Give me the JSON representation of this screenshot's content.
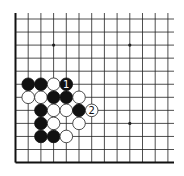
{
  "diagram": {
    "type": "go-board-fragment",
    "colors": {
      "background": "#ffffff",
      "line": "#222222",
      "border": "#111111",
      "black_stone": "#111111",
      "white_stone": "#ffffff",
      "white_stone_outline": "#222222"
    },
    "grid": {
      "columns": 13,
      "rows": 12,
      "origin_x": 15.5,
      "origin_y": 19,
      "col_spacing": 12.7,
      "row_spacing": 13.05,
      "line_extend_right": 174,
      "line_extend_top": 13,
      "thick_edges": [
        "left",
        "bottom"
      ]
    },
    "star_points": [
      {
        "col": 3,
        "row": 2
      },
      {
        "col": 9,
        "row": 2
      },
      {
        "col": 9,
        "row": 8
      }
    ],
    "stones": [
      {
        "col": 1,
        "row": 5,
        "color": "black"
      },
      {
        "col": 2,
        "row": 5,
        "color": "black"
      },
      {
        "col": 3,
        "row": 5,
        "color": "white"
      },
      {
        "col": 4,
        "row": 5,
        "color": "black",
        "label": "1"
      },
      {
        "col": 1,
        "row": 6,
        "color": "white"
      },
      {
        "col": 2,
        "row": 6,
        "color": "white"
      },
      {
        "col": 3,
        "row": 6,
        "color": "black"
      },
      {
        "col": 4,
        "row": 6,
        "color": "black"
      },
      {
        "col": 5,
        "row": 6,
        "color": "white"
      },
      {
        "col": 2,
        "row": 7,
        "color": "black"
      },
      {
        "col": 3,
        "row": 7,
        "color": "white"
      },
      {
        "col": 4,
        "row": 7,
        "color": "white"
      },
      {
        "col": 5,
        "row": 7,
        "color": "black"
      },
      {
        "col": 6,
        "row": 7,
        "color": "white",
        "label": "2"
      },
      {
        "col": 2,
        "row": 8,
        "color": "black"
      },
      {
        "col": 3,
        "row": 8,
        "color": "white"
      },
      {
        "col": 5,
        "row": 8,
        "color": "white"
      },
      {
        "col": 2,
        "row": 9,
        "color": "black"
      },
      {
        "col": 3,
        "row": 9,
        "color": "black"
      },
      {
        "col": 4,
        "row": 9,
        "color": "white"
      }
    ],
    "move_labels": [
      {
        "number": "1",
        "color": "black",
        "col": 4,
        "row": 5
      },
      {
        "number": "2",
        "color": "white",
        "col": 6,
        "row": 7
      }
    ]
  }
}
